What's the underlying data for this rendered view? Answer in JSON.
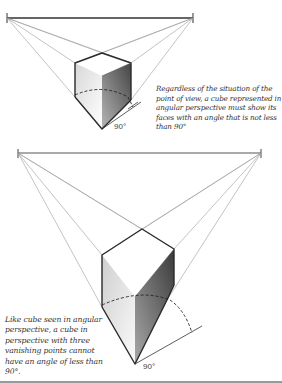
{
  "figures": [
    {
      "id": "angular-perspective",
      "caption": "Regardless of the situation of the point of view, a cube represented in angular perspective must show its faces with an angle that is not less than 90°",
      "angle_label": "90°"
    },
    {
      "id": "three-point-perspective",
      "caption": "Like cube seen in angular perspective, a cube in perspective with three vanishing points cannot have an angle of less than 90°.",
      "angle_label": "90°"
    }
  ],
  "colors": {
    "edge": "#2a2a2a",
    "construction_line": "#9a9a9a",
    "light_face": "#e6e6e6",
    "dark_face": "#555555"
  }
}
